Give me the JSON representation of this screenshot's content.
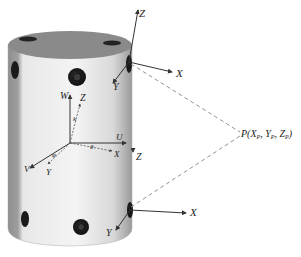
{
  "diagram": {
    "type": "cylinder-with-coordinate-frames",
    "colors": {
      "cylinder_light": "#f2f2f2",
      "cylinder_dark": "#9a9a9a",
      "cylinder_top": "#8c8c8c",
      "sensor": "#2a2a2a",
      "axis": "#333333",
      "dashed": "#888888"
    },
    "top_frame": {
      "z": "Z",
      "x": "X",
      "y": "Y"
    },
    "center_frame": {
      "w": "W",
      "u": "U",
      "v": "V",
      "z": "Z",
      "x": "X",
      "y": "Y",
      "angle_k": "k",
      "angle_phi": "φ",
      "angle_theta": "θ"
    },
    "side_label": {
      "z": "Z"
    },
    "bottom_frame": {
      "x": "X",
      "y": "Y"
    },
    "point": {
      "label": "P(X",
      "xp": "P",
      "sep1": ", Y",
      "yp": "P",
      "sep2": ", Z",
      "zp": "P",
      "close": ")"
    }
  }
}
